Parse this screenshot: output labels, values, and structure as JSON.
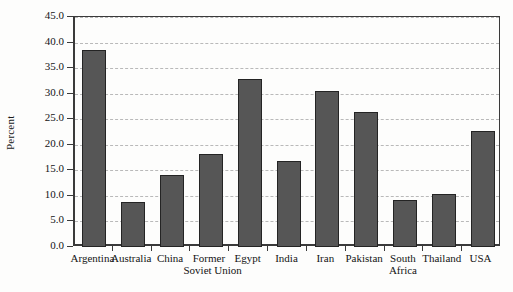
{
  "chart_data": {
    "type": "bar",
    "title": "",
    "xlabel": "",
    "ylabel": "Percent",
    "categories": [
      "Argentina",
      "Australia",
      "China",
      "Former Soviet Union",
      "Egypt",
      "India",
      "Iran",
      "Pakistan",
      "South Africa",
      "Thailand",
      "USA"
    ],
    "values": [
      38.6,
      8.9,
      14.1,
      18.2,
      32.8,
      16.9,
      30.5,
      26.4,
      9.2,
      10.4,
      22.7
    ],
    "ylim": [
      0.0,
      45.0
    ],
    "ytick_values": [
      0.0,
      5.0,
      10.0,
      15.0,
      20.0,
      25.0,
      30.0,
      35.0,
      40.0,
      45.0
    ],
    "ytick_labels": [
      "0.0",
      "5.0",
      "10.0",
      "15.0",
      "20.0",
      "25.0",
      "30.0",
      "35.0",
      "40.0",
      "45.0"
    ],
    "grid": true,
    "legend": null,
    "bar_color": "#565656",
    "bar_edge_color": "#242424"
  },
  "axis": {
    "y_title": "Percent"
  },
  "category_labels": [
    {
      "line1": "Argentina",
      "line2": ""
    },
    {
      "line1": "Australia",
      "line2": ""
    },
    {
      "line1": "China",
      "line2": ""
    },
    {
      "line1": "Former",
      "line2": "Soviet Union"
    },
    {
      "line1": "Egypt",
      "line2": ""
    },
    {
      "line1": "India",
      "line2": ""
    },
    {
      "line1": "Iran",
      "line2": ""
    },
    {
      "line1": "Pakistan",
      "line2": ""
    },
    {
      "line1": "South",
      "line2": "Africa"
    },
    {
      "line1": "Thailand",
      "line2": ""
    },
    {
      "line1": "USA",
      "line2": ""
    }
  ]
}
